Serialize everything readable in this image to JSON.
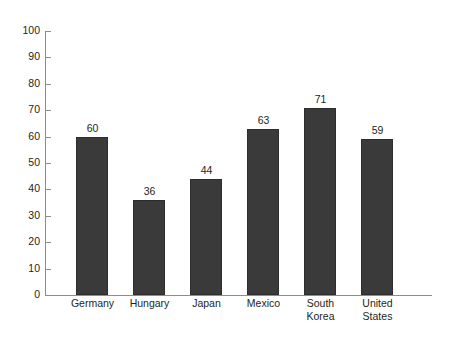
{
  "chart_data": {
    "type": "bar",
    "title": "",
    "subtitle": "",
    "xlabel": "",
    "ylabel": "",
    "categories": [
      "Germany",
      "Hungary",
      "Japan",
      "Mexico",
      "South Korea",
      "United States"
    ],
    "category_lines": [
      [
        "Germany"
      ],
      [
        "Hungary"
      ],
      [
        "Japan"
      ],
      [
        "Mexico"
      ],
      [
        "South",
        "Korea"
      ],
      [
        "United",
        "States"
      ]
    ],
    "values": [
      60,
      36,
      44,
      63,
      71,
      59
    ],
    "value_labels": [
      "60",
      "36",
      "44",
      "63",
      "71",
      "59"
    ],
    "ylim": [
      0,
      100
    ],
    "y_ticks": [
      0,
      10,
      20,
      30,
      40,
      50,
      60,
      70,
      80,
      90,
      100
    ],
    "y_tick_labels": [
      "0",
      "10",
      "20",
      "30",
      "40",
      "50",
      "60",
      "70",
      "80",
      "90",
      "100"
    ],
    "grid": false,
    "legend": false,
    "legend_position": "none",
    "bar_color": "#3a3a3a",
    "axis_color": "#8c8c8c",
    "text_color": "#231f20",
    "background_color": "#ffffff"
  }
}
